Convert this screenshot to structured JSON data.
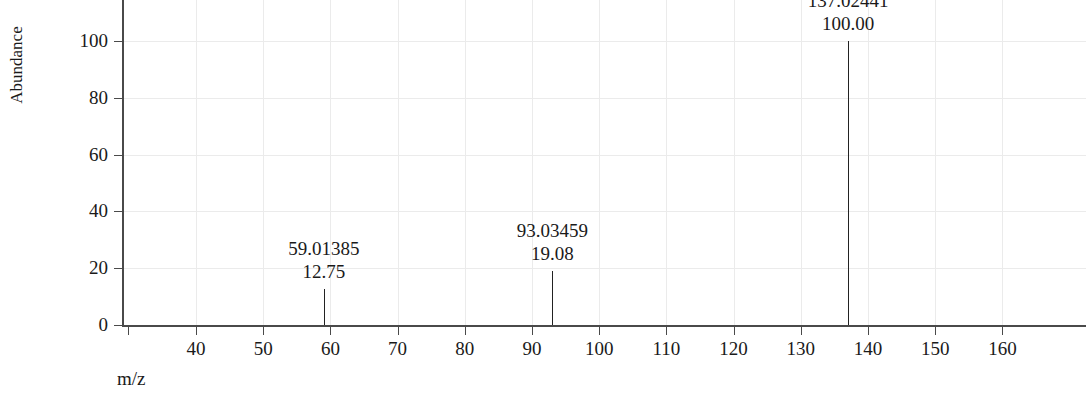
{
  "chart_data": {
    "type": "bar",
    "title": "",
    "xlabel": "m/z",
    "ylabel": "Abundance",
    "xlim": [
      30,
      168
    ],
    "ylim": [
      0,
      108
    ],
    "grid": true,
    "legend": false,
    "x_ticks": [
      40,
      50,
      60,
      70,
      80,
      90,
      100,
      110,
      120,
      130,
      140,
      150,
      160
    ],
    "x_tick_labels": [
      "40",
      "50",
      "60",
      "70",
      "80",
      "90",
      "100",
      "110",
      "120",
      "130",
      "140",
      "150",
      "160"
    ],
    "y_ticks": [
      0,
      20,
      40,
      60,
      80,
      100
    ],
    "y_tick_labels": [
      "0",
      "20",
      "40",
      "60",
      "80",
      "100"
    ],
    "x": [
      59.01385,
      93.03459,
      137.02441
    ],
    "values": [
      12.75,
      19.08,
      100.0
    ],
    "peaks": [
      {
        "mz_label": "59.01385",
        "intensity_label": "12.75",
        "mz": 59.01385,
        "intensity": 12.75
      },
      {
        "mz_label": "93.03459",
        "intensity_label": "19.08",
        "mz": 93.03459,
        "intensity": 19.08
      },
      {
        "mz_label": "137.02441",
        "intensity_label": "100.00",
        "mz": 137.02441,
        "intensity": 100.0
      }
    ],
    "annotations": [
      "59.01385",
      "12.75",
      "93.03459",
      "19.08",
      "137.02441",
      "100.00"
    ],
    "colors": {
      "peak": "#222222",
      "axis": "#4a4a4a",
      "grid": "#ebebeb",
      "background": "#ffffff",
      "text": "#1a1a1a"
    }
  }
}
